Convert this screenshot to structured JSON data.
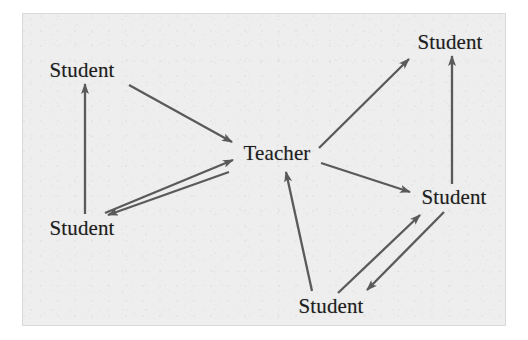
{
  "figure": {
    "type": "node-link-diagram",
    "title": "",
    "background_color": "#eeeeee",
    "page_color": "#ffffff",
    "ink_color": "#5a5a5a",
    "text_color": "#1d1d1d",
    "frame": {
      "x": 22,
      "y": 13,
      "width": 484,
      "height": 313
    }
  },
  "nodes": [
    {
      "id": "student_top_left",
      "label": "Student",
      "x": 82,
      "y": 70
    },
    {
      "id": "student_bottom_left",
      "label": "Student",
      "x": 82,
      "y": 228
    },
    {
      "id": "teacher",
      "label": "Teacher",
      "x": 277,
      "y": 153
    },
    {
      "id": "student_top_right",
      "label": "Student",
      "x": 450,
      "y": 42
    },
    {
      "id": "student_mid_right",
      "label": "Student",
      "x": 454,
      "y": 197
    },
    {
      "id": "student_bottom",
      "label": "Student",
      "x": 331,
      "y": 306
    }
  ],
  "edges": [
    {
      "id": "e1",
      "from": "student_bottom_left",
      "to": "student_top_left",
      "direction": "one-way",
      "x1": 85,
      "y1": 214,
      "x2": 85,
      "y2": 84
    },
    {
      "id": "e2",
      "from": "student_top_left",
      "to": "teacher",
      "direction": "one-way",
      "x1": 129,
      "y1": 85,
      "x2": 232,
      "y2": 142
    },
    {
      "id": "e3",
      "from": "student_bottom_left",
      "to": "teacher",
      "direction": "one-way",
      "x1": 105,
      "y1": 213,
      "x2": 233,
      "y2": 160
    },
    {
      "id": "e4",
      "from": "teacher",
      "to": "student_bottom_left",
      "direction": "one-way",
      "x1": 229,
      "y1": 172,
      "x2": 108,
      "y2": 215
    },
    {
      "id": "e5",
      "from": "teacher",
      "to": "student_top_right",
      "direction": "one-way",
      "x1": 319,
      "y1": 148,
      "x2": 409,
      "y2": 59
    },
    {
      "id": "e6",
      "from": "teacher",
      "to": "student_mid_right",
      "direction": "one-way",
      "x1": 321,
      "y1": 163,
      "x2": 410,
      "y2": 192
    },
    {
      "id": "e7",
      "from": "student_bottom",
      "to": "teacher",
      "direction": "one-way",
      "x1": 312,
      "y1": 291,
      "x2": 286,
      "y2": 172
    },
    {
      "id": "e8",
      "from": "student_mid_right",
      "to": "student_top_right",
      "direction": "one-way",
      "x1": 452,
      "y1": 184,
      "x2": 452,
      "y2": 56
    },
    {
      "id": "e9",
      "from": "student_bottom",
      "to": "student_mid_right",
      "direction": "one-way",
      "x1": 338,
      "y1": 293,
      "x2": 420,
      "y2": 215
    },
    {
      "id": "e10",
      "from": "student_mid_right",
      "to": "student_bottom",
      "direction": "one-way",
      "x1": 444,
      "y1": 212,
      "x2": 367,
      "y2": 290
    }
  ],
  "legend": {
    "relationship": "directed interaction",
    "node_count": 6,
    "edge_count": 10
  }
}
